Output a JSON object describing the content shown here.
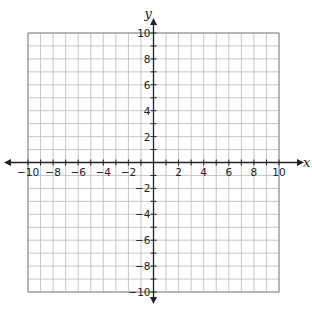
{
  "chart_data": {
    "type": "scatter",
    "title": "",
    "subtitle": "",
    "xlabel": "x",
    "ylabel": "y",
    "xlim": [
      -10,
      10
    ],
    "ylim": [
      -10,
      10
    ],
    "grid": true,
    "grid_step": 1,
    "legend": null,
    "x_tick_labels": [
      "-10",
      "-8",
      "-6",
      "-4",
      "-2",
      "2",
      "4",
      "6",
      "8",
      "10"
    ],
    "y_tick_labels": [
      "10",
      "8",
      "6",
      "4",
      "2",
      "-2",
      "-4",
      "-6",
      "-8",
      "-10"
    ],
    "x_ticks": [
      -10,
      -8,
      -6,
      -4,
      -2,
      2,
      4,
      6,
      8,
      10
    ],
    "y_ticks": [
      10,
      8,
      6,
      4,
      2,
      -2,
      -4,
      -6,
      -8,
      -10
    ],
    "series": []
  },
  "colors": {
    "grid": "#b9b9b9",
    "axis": "#222222",
    "background": "#ffffff"
  }
}
